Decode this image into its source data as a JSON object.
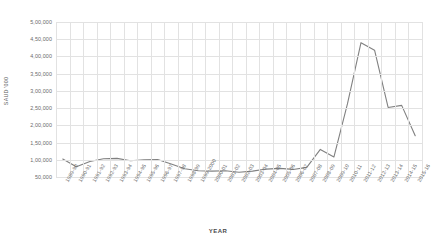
{
  "chart_data": {
    "type": "line",
    "title": "",
    "xlabel": "YEAR",
    "ylabel": "SAUD '000",
    "ylim": [
      0,
      500000
    ],
    "ytick_values": [
      500000,
      450000,
      400000,
      350000,
      300000,
      250000,
      200000,
      150000,
      100000,
      50000
    ],
    "ytick_labels": [
      "5,00,000",
      "4,50,000",
      "4,00,000",
      "3,50,000",
      "3,00,000",
      "2,50,000",
      "2,00,000",
      "1,50,000",
      "1,00,000",
      "50,000"
    ],
    "grid": true,
    "legend": "none",
    "line_color": "#808080",
    "categories": [
      "1989-90",
      "1990-91",
      "1991-92",
      "1992-93",
      "1993-94",
      "1994-95",
      "1995-96",
      "1996-97",
      "1997-98",
      "1998-99",
      "1999-2000",
      "2000-01",
      "2001-02",
      "2002-03",
      "2003-04",
      "2004-05",
      "2005-06",
      "2006-07",
      "2007-08",
      "2008-09",
      "2009-10",
      "2010-11",
      "2011-12",
      "2012-13",
      "2013-14",
      "2014-15",
      "2015-16"
    ],
    "series": [
      {
        "name": "SAUD '000",
        "values": [
          102000,
          80000,
          95000,
          103000,
          104000,
          97000,
          100000,
          101000,
          88000,
          74000,
          68000,
          67000,
          68000,
          64000,
          67000,
          73000,
          75000,
          72000,
          78000,
          130000,
          108000,
          262000,
          440000,
          418000,
          252000,
          258000,
          170000
        ]
      }
    ]
  }
}
